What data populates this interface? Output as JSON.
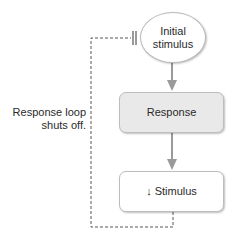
{
  "diagram": {
    "nodes": {
      "initial_stimulus": {
        "line1": "Initial",
        "line2": "stimulus"
      },
      "response": {
        "label": "Response"
      },
      "decreased_stimulus": {
        "arrow": "↓",
        "label": "Stimulus"
      }
    },
    "feedback_label": {
      "line1": "Response loop",
      "line2": "shuts off."
    },
    "edges": [
      {
        "from": "initial_stimulus",
        "to": "response",
        "style": "solid-arrow"
      },
      {
        "from": "response",
        "to": "decreased_stimulus",
        "style": "solid-arrow"
      },
      {
        "from": "decreased_stimulus",
        "to": "initial_stimulus",
        "style": "dashed-inhibit"
      }
    ],
    "colors": {
      "response_fill": "#e9e9e9",
      "arrow": "#9a9a9a",
      "dashed": "#555555"
    }
  }
}
